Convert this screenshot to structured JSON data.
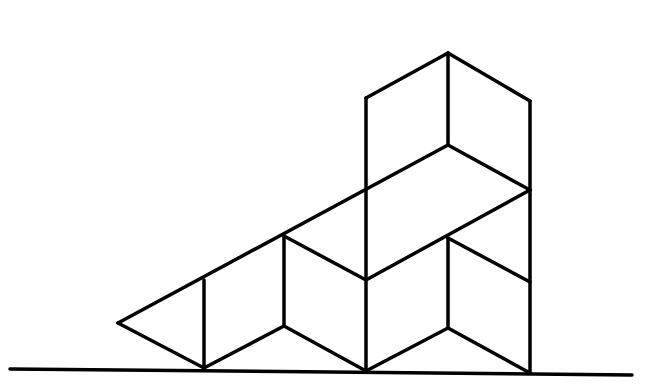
{
  "diagram": {
    "title": "",
    "stroke_color": "#000000",
    "background": "#ffffff",
    "stroke_width": 3.5,
    "ground": {
      "x1": 10,
      "y1": 369,
      "x2": 632,
      "y2": 375
    },
    "segments": [
      {
        "x1": 118,
        "y1": 323,
        "x2": 448,
        "y2": 145
      },
      {
        "x1": 118,
        "y1": 323,
        "x2": 204,
        "y2": 368
      },
      {
        "x1": 204,
        "y1": 280,
        "x2": 204,
        "y2": 368
      },
      {
        "x1": 204,
        "y1": 368,
        "x2": 284,
        "y2": 326
      },
      {
        "x1": 284,
        "y1": 236,
        "x2": 284,
        "y2": 326
      },
      {
        "x1": 284,
        "y1": 236,
        "x2": 366,
        "y2": 280
      },
      {
        "x1": 284,
        "y1": 326,
        "x2": 366,
        "y2": 371
      },
      {
        "x1": 366,
        "y1": 98,
        "x2": 366,
        "y2": 371
      },
      {
        "x1": 366,
        "y1": 98,
        "x2": 448,
        "y2": 53
      },
      {
        "x1": 448,
        "y1": 53,
        "x2": 448,
        "y2": 145
      },
      {
        "x1": 448,
        "y1": 53,
        "x2": 530,
        "y2": 101
      },
      {
        "x1": 448,
        "y1": 145,
        "x2": 530,
        "y2": 190
      },
      {
        "x1": 530,
        "y1": 101,
        "x2": 530,
        "y2": 373
      },
      {
        "x1": 366,
        "y1": 280,
        "x2": 530,
        "y2": 190
      },
      {
        "x1": 448,
        "y1": 238,
        "x2": 448,
        "y2": 328
      },
      {
        "x1": 448,
        "y1": 238,
        "x2": 530,
        "y2": 282
      },
      {
        "x1": 366,
        "y1": 371,
        "x2": 448,
        "y2": 328
      },
      {
        "x1": 448,
        "y1": 328,
        "x2": 530,
        "y2": 373
      }
    ]
  }
}
